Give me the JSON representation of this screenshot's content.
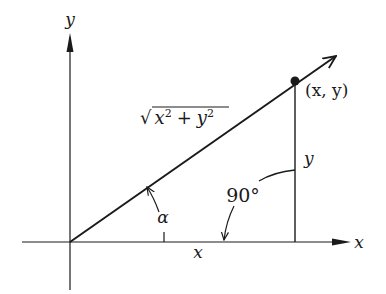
{
  "diagram": {
    "type": "right-triangle-polar-coordinates",
    "colors": {
      "ink": "#1a1a1a",
      "background": "#ffffff"
    },
    "axes": {
      "x_label": "x",
      "y_label": "y"
    },
    "point": {
      "label": "(x, y)"
    },
    "hypotenuse": {
      "label_radical": "√",
      "label_x": "x",
      "label_exp1": "2",
      "label_plus": "+",
      "label_y": "y",
      "label_exp2": "2",
      "label_full": "√(x² + y²)"
    },
    "legs": {
      "vertical_label": "y",
      "horizontal_label": "x"
    },
    "angles": {
      "alpha_label": "α",
      "right_angle_label": "90°"
    }
  }
}
